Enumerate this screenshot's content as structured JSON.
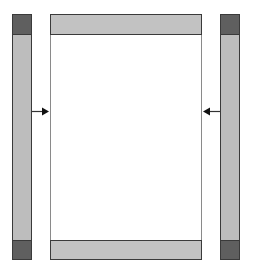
{
  "diagram": {
    "colors": {
      "side_fill": "#bdbdbd",
      "cap_fill": "#5f5f5f",
      "bar_fill": "#c2c2c2",
      "outline": "#3a3a3a",
      "frame_outline": "#8a8a8a"
    },
    "arrows": [
      {
        "side": "left",
        "direction": "right"
      },
      {
        "side": "right",
        "direction": "left"
      }
    ]
  }
}
